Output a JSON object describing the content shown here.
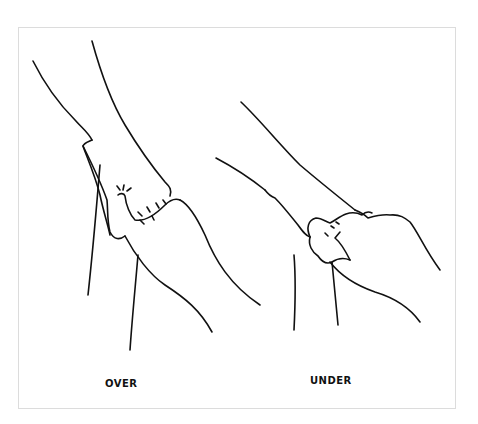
{
  "figure": {
    "panels": [
      {
        "id": "over",
        "caption": "OVER"
      },
      {
        "id": "under",
        "caption": "UNDER"
      }
    ],
    "colors": {
      "ink": "#111111",
      "frame": "#dcdcdc",
      "background": "#ffffff"
    }
  }
}
